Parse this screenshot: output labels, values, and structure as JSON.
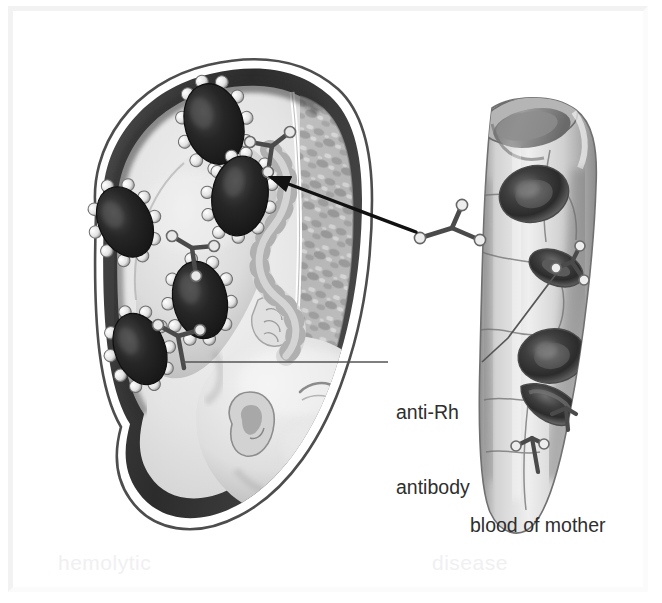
{
  "figure": {
    "width": 662,
    "height": 603,
    "background": "#ffffff",
    "border_color": "#f2f2f2"
  },
  "labels": {
    "antibody_line1": "anti-Rh",
    "antibody_line2": "antibody",
    "blood_of_mother": "blood of mother"
  },
  "ghost_text": {
    "left": "hemolytic",
    "right": "disease"
  },
  "colors": {
    "ink": "#2e2e2e",
    "leader_line": "#555555",
    "arrow": "#111111",
    "womb_wall": "#3a3a3a",
    "womb_rim": "#ffffff",
    "amniotic_fluid": "#e9e9e9",
    "fetus_skin": "#dcdcdc",
    "placenta_mottle": "#9a9a9a",
    "rbc_fetal_dark": "#2a2a2a",
    "rbc_knob": "#f2f2f2",
    "vessel_wall": "#cfcfcf",
    "vessel_lumen": "#b6b6b6",
    "rbc_maternal": "#5c5c5c",
    "antibody_stroke": "#4a4a4a"
  },
  "scene": {
    "womb": {
      "name": "uterus-cross-section",
      "description": "Large ovoid uterus in left two-thirds, shown in cut-away with white outer rim and dark muscular wall"
    },
    "fetus": {
      "name": "fetus",
      "description": "Curled fetus with head at lower right of the uterus, ear and closed eye visible, umbilical cord twisting upward"
    },
    "placenta": {
      "name": "placenta",
      "description": "Mottled textured tissue along the right inner wall of the uterus"
    },
    "maternal_vessel": {
      "name": "maternal-blood-vessel",
      "description": "Cut cylindrical blood vessel on the right side, angled down-right, with open elliptical end at top",
      "red_blood_cells": 4,
      "surface_antibodies": 3
    },
    "free_antibody": {
      "name": "free-anti-rh-antibody",
      "description": "Single Y-shaped antibody between the vessel and the uterus, with a curved arrow pointing into the uterus"
    },
    "fetal_red_blood_cells": {
      "name": "fetal-red-blood-cells",
      "count": 5,
      "description": "Dark oval fetal red blood cells studded with light knobs where anti-Rh antibodies have bound"
    },
    "bound_antibodies": {
      "name": "bound-antibodies",
      "count": 3,
      "description": "Y-shaped antibodies attached to fetal red blood cells inside the uterus"
    }
  },
  "annotations": {
    "arrow": {
      "name": "transfer-arrow",
      "from": "free anti-Rh antibody near maternal vessel",
      "to": "fetal red blood cell inside uterus"
    },
    "leader_left": {
      "name": "leader-line-to-fetal-antibody",
      "points_to": "antibody bound to fetal red blood cell"
    },
    "leader_right": {
      "name": "leader-line-to-maternal-antibody",
      "points_to": "antibody on maternal vessel wall"
    }
  }
}
